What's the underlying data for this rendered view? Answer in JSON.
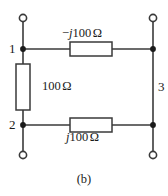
{
  "figure": {
    "caption": "(b)",
    "background_color": "#ffffff",
    "line_color": "#3a3a3a",
    "text_color": "#1a1a1a",
    "width": 168,
    "height": 196
  },
  "nodes": [
    {
      "id": "node-1",
      "label": "1",
      "x": 23,
      "y": 49,
      "type": "filled-dot"
    },
    {
      "id": "node-2",
      "label": "2",
      "x": 23,
      "y": 125,
      "type": "filled-dot"
    },
    {
      "id": "node-3",
      "label": "3",
      "x": 153,
      "y": 87,
      "type": "wire-label"
    }
  ],
  "terminals": [
    {
      "id": "terminal-top-left",
      "x": 23,
      "y": 18,
      "type": "open-circle"
    },
    {
      "id": "terminal-top-right",
      "x": 153,
      "y": 18,
      "type": "open-circle"
    },
    {
      "id": "terminal-bottom-left",
      "x": 23,
      "y": 155,
      "type": "open-circle"
    },
    {
      "id": "terminal-bottom-right",
      "x": 153,
      "y": 155,
      "type": "open-circle"
    }
  ],
  "components": [
    {
      "id": "impedance-top",
      "kind": "impedance",
      "orientation": "horizontal",
      "sign": "−",
      "imag_unit": "j",
      "magnitude": "100",
      "unit": "Ω",
      "label": "−j100 Ω",
      "between": [
        "node-1",
        "node-3"
      ]
    },
    {
      "id": "resistor-left",
      "kind": "resistor",
      "orientation": "vertical",
      "sign": "",
      "imag_unit": "",
      "magnitude": "100",
      "unit": "Ω",
      "label": "100 Ω",
      "between": [
        "node-1",
        "node-2"
      ]
    },
    {
      "id": "impedance-bottom",
      "kind": "impedance",
      "orientation": "horizontal",
      "sign": "",
      "imag_unit": "j",
      "magnitude": "100",
      "unit": "Ω",
      "label": "j100 Ω",
      "between": [
        "node-2",
        "node-3"
      ]
    }
  ]
}
